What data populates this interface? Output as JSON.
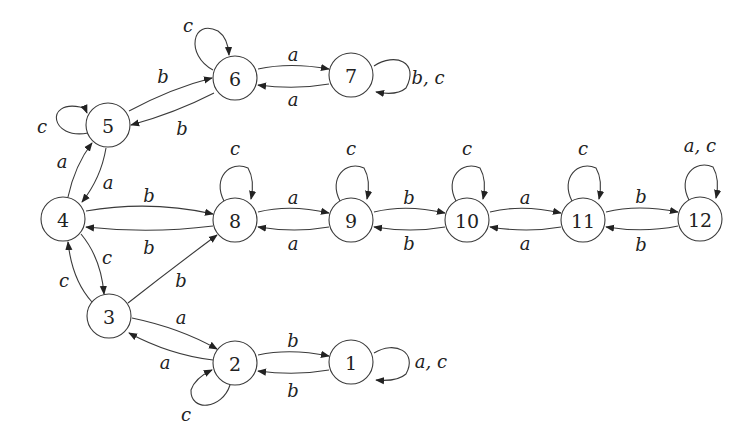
{
  "diagram": {
    "type": "state-transition-graph",
    "node_radius": 22,
    "stroke_color": "#3a3a3a",
    "nodes": [
      {
        "id": "1",
        "label": "1",
        "x": 351,
        "y": 362
      },
      {
        "id": "2",
        "label": "2",
        "x": 235,
        "y": 363
      },
      {
        "id": "3",
        "label": "3",
        "x": 109,
        "y": 316
      },
      {
        "id": "4",
        "label": "4",
        "x": 63,
        "y": 219
      },
      {
        "id": "5",
        "label": "5",
        "x": 108,
        "y": 125
      },
      {
        "id": "6",
        "label": "6",
        "x": 235,
        "y": 78
      },
      {
        "id": "7",
        "label": "7",
        "x": 351,
        "y": 75
      },
      {
        "id": "8",
        "label": "8",
        "x": 235,
        "y": 220
      },
      {
        "id": "9",
        "label": "9",
        "x": 351,
        "y": 220
      },
      {
        "id": "10",
        "label": "10",
        "x": 467,
        "y": 220
      },
      {
        "id": "11",
        "label": "11",
        "x": 583,
        "y": 220
      },
      {
        "id": "12",
        "label": "12",
        "x": 700,
        "y": 219
      }
    ],
    "edges": [
      {
        "from": "5",
        "to": "6",
        "label": "b",
        "path": "M129,111 Q172,88 212,78",
        "lx": 163,
        "ly": 76
      },
      {
        "from": "6",
        "to": "5",
        "label": "b",
        "path": "M214,93 Q175,113 131,125",
        "lx": 182,
        "ly": 128
      },
      {
        "from": "6",
        "to": "7",
        "label": "a",
        "path": "M258,69 Q290,62 329,69",
        "lx": 293,
        "ly": 54
      },
      {
        "from": "7",
        "to": "6",
        "label": "a",
        "path": "M329,84 Q295,90 258,85",
        "lx": 293,
        "ly": 99
      },
      {
        "from": "6",
        "to": "6",
        "label": "c",
        "path": "M213,70 C185,55 192,18 218,31 Q228,38 229,55",
        "lx": 188,
        "ly": 25
      },
      {
        "from": "7",
        "to": "7",
        "label": "b, c",
        "path": "M374,66 C395,52 420,62 406,88 Q397,96 376,92",
        "lx": 428,
        "ly": 77
      },
      {
        "from": "5",
        "to": "5",
        "label": "c",
        "path": "M88,133 C50,140 45,100 80,107 Q85,108 87,113",
        "lx": 42,
        "ly": 126
      },
      {
        "from": "4",
        "to": "5",
        "label": "a",
        "path": "M68,197 Q75,165 92,143",
        "lx": 62,
        "ly": 161
      },
      {
        "from": "5",
        "to": "4",
        "label": "a",
        "path": "M106,148 Q101,178 82,202",
        "lx": 108,
        "ly": 182
      },
      {
        "from": "4",
        "to": "8",
        "label": "b",
        "path": "M86,211 Q150,200 213,214",
        "lx": 149,
        "ly": 195
      },
      {
        "from": "8",
        "to": "4",
        "label": "b",
        "path": "M213,226 Q150,234 86,227",
        "lx": 149,
        "ly": 247
      },
      {
        "from": "4",
        "to": "3",
        "label": "c",
        "path": "M81,234 Q101,258 104,294",
        "lx": 107,
        "ly": 257
      },
      {
        "from": "3",
        "to": "4",
        "label": "c",
        "path": "M92,302 Q72,280 68,242",
        "lx": 64,
        "ly": 280
      },
      {
        "from": "3",
        "to": "8",
        "label": "b",
        "path": "M128,303 Q170,270 217,235",
        "lx": 181,
        "ly": 280
      },
      {
        "from": "8",
        "to": "8",
        "label": "c",
        "path": "M224,201 C212,178 230,160 248,168 Q255,180 251,199",
        "lx": 235,
        "ly": 148
      },
      {
        "from": "8",
        "to": "9",
        "label": "a",
        "path": "M258,212 Q290,204 329,213",
        "lx": 293,
        "ly": 197
      },
      {
        "from": "9",
        "to": "8",
        "label": "a",
        "path": "M329,227 Q295,233 258,227",
        "lx": 293,
        "ly": 243
      },
      {
        "from": "9",
        "to": "9",
        "label": "c",
        "path": "M340,201 C328,178 346,160 364,168 Q371,180 367,199",
        "lx": 351,
        "ly": 148
      },
      {
        "from": "9",
        "to": "10",
        "label": "b",
        "path": "M374,212 Q406,204 445,213",
        "lx": 409,
        "ly": 197
      },
      {
        "from": "10",
        "to": "9",
        "label": "b",
        "path": "M445,227 Q411,233 374,227",
        "lx": 409,
        "ly": 243
      },
      {
        "from": "10",
        "to": "10",
        "label": "c",
        "path": "M456,201 C444,178 462,160 480,168 Q487,180 483,199",
        "lx": 467,
        "ly": 148
      },
      {
        "from": "10",
        "to": "11",
        "label": "a",
        "path": "M490,212 Q522,204 561,213",
        "lx": 525,
        "ly": 197
      },
      {
        "from": "11",
        "to": "10",
        "label": "a",
        "path": "M561,227 Q527,233 490,227",
        "lx": 525,
        "ly": 243
      },
      {
        "from": "11",
        "to": "11",
        "label": "c",
        "path": "M572,201 C560,178 578,160 596,168 Q603,180 599,199",
        "lx": 583,
        "ly": 148
      },
      {
        "from": "11",
        "to": "12",
        "label": "b",
        "path": "M606,212 Q638,204 678,212",
        "lx": 641,
        "ly": 196
      },
      {
        "from": "12",
        "to": "11",
        "label": "b",
        "path": "M678,226 Q644,233 606,227",
        "lx": 641,
        "ly": 244
      },
      {
        "from": "12",
        "to": "12",
        "label": "a, c",
        "path": "M689,200 C677,177 695,159 713,167 Q720,179 716,198",
        "lx": 700,
        "ly": 145
      },
      {
        "from": "3",
        "to": "2",
        "label": "a",
        "path": "M132,318 Q180,328 217,349",
        "lx": 181,
        "ly": 317
      },
      {
        "from": "2",
        "to": "3",
        "label": "a",
        "path": "M213,360 Q170,355 129,333",
        "lx": 165,
        "ly": 362
      },
      {
        "from": "2",
        "to": "1",
        "label": "b",
        "path": "M258,355 Q290,348 329,356",
        "lx": 293,
        "ly": 340
      },
      {
        "from": "1",
        "to": "2",
        "label": "b",
        "path": "M329,370 Q295,376 258,371",
        "lx": 293,
        "ly": 390
      },
      {
        "from": "2",
        "to": "2",
        "label": "c",
        "path": "M230,385 C222,410 190,412 191,390 Q195,378 212,370",
        "lx": 186,
        "ly": 414
      },
      {
        "from": "1",
        "to": "1",
        "label": "a, c",
        "path": "M374,353 C395,340 418,352 406,374 Q397,382 376,380",
        "lx": 431,
        "ly": 361
      }
    ]
  }
}
